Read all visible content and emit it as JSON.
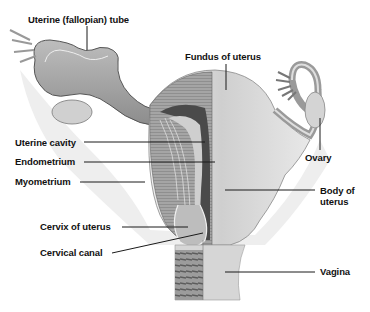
{
  "diagram": {
    "style": "grayscale medical illustration",
    "labels": [
      {
        "id": "uterine-tube",
        "text": "Uterine (fallopian) tube"
      },
      {
        "id": "fundus",
        "text": "Fundus of uterus"
      },
      {
        "id": "uterine-cavity",
        "text": "Uterine cavity"
      },
      {
        "id": "endometrium",
        "text": "Endometrium"
      },
      {
        "id": "myometrium",
        "text": "Myometrium"
      },
      {
        "id": "ovary",
        "text": "Ovary"
      },
      {
        "id": "body-of-uterus",
        "text": "Body of uterus"
      },
      {
        "id": "cervix",
        "text": "Cervix of uterus"
      },
      {
        "id": "cervical-canal",
        "text": "Cervical canal"
      },
      {
        "id": "vagina",
        "text": "Vagina"
      }
    ],
    "colors": {
      "background": "#ffffff",
      "tissue_light": "#d9d9d9",
      "tissue_mid": "#a8a8a8",
      "tissue_dark": "#555555",
      "leader_line": "#1a1a1a",
      "label_text": "#111111"
    }
  }
}
